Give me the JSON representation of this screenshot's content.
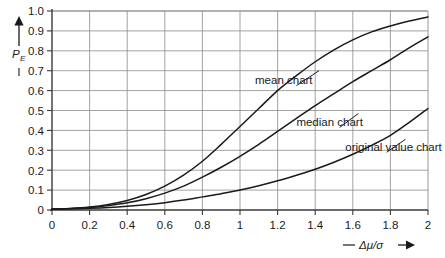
{
  "chart_data": {
    "type": "line",
    "title": "",
    "subtitle": "",
    "xlabel": "— Δμ/σ →",
    "xlabel_prefix": "—",
    "xlabel_symbol": "Δμ/σ",
    "xlabel_arrow": "→",
    "ylabel": "PE",
    "ylabel_main": "P",
    "ylabel_sub": "E",
    "ylabel_arrow": "↑",
    "xlim": [
      0,
      2
    ],
    "ylim": [
      0,
      1.0
    ],
    "grid": true,
    "legend_position": "inline-annotations",
    "xticks": [
      0,
      0.2,
      0.4,
      0.6,
      0.8,
      1,
      1.2,
      1.4,
      1.6,
      1.8,
      2
    ],
    "xticklabels": [
      "0",
      "0.2",
      "0.4",
      "0.6",
      "0.8",
      "1",
      "1.2",
      "1.4",
      "1.6",
      "1.8",
      "2"
    ],
    "yticks": [
      0,
      0.1,
      0.2,
      0.3,
      0.4,
      0.5,
      0.6,
      0.7,
      0.8,
      0.9,
      1.0
    ],
    "yticklabels": [
      "0",
      "0.1",
      "0.2",
      "0.3",
      "0.4",
      "0.5",
      "0.6",
      "0.7",
      "0.8",
      "0.9",
      "1.0"
    ],
    "x": [
      0,
      0.1,
      0.2,
      0.3,
      0.4,
      0.5,
      0.6,
      0.7,
      0.8,
      0.9,
      1.0,
      1.1,
      1.2,
      1.3,
      1.4,
      1.5,
      1.6,
      1.7,
      1.8,
      1.9,
      2.0
    ],
    "series": [
      {
        "name": "mean chart",
        "label": "mean chart",
        "values": [
          0.005,
          0.008,
          0.015,
          0.028,
          0.048,
          0.078,
          0.12,
          0.175,
          0.245,
          0.33,
          0.42,
          0.51,
          0.6,
          0.675,
          0.745,
          0.805,
          0.855,
          0.895,
          0.925,
          0.95,
          0.97
        ],
        "label_x": 1.08,
        "label_y": 0.655,
        "leader_from_x": 1.3,
        "leader_from_y": 0.625,
        "leader_to_x": 1.42,
        "leader_to_y": 0.7
      },
      {
        "name": "median chart",
        "label": "median chart",
        "values": [
          0.005,
          0.007,
          0.012,
          0.022,
          0.036,
          0.057,
          0.085,
          0.12,
          0.165,
          0.215,
          0.27,
          0.33,
          0.395,
          0.46,
          0.525,
          0.585,
          0.645,
          0.7,
          0.755,
          0.815,
          0.87
        ],
        "label_x": 1.3,
        "label_y": 0.44,
        "leader_from_x": 1.53,
        "leader_from_y": 0.415,
        "leader_to_x": 1.63,
        "leader_to_y": 0.485
      },
      {
        "name": "original value chart",
        "label": "original value chart",
        "values": [
          0.005,
          0.006,
          0.009,
          0.013,
          0.019,
          0.027,
          0.037,
          0.05,
          0.066,
          0.082,
          0.1,
          0.122,
          0.147,
          0.175,
          0.205,
          0.24,
          0.28,
          0.325,
          0.375,
          0.44,
          0.51
        ],
        "label_x": 1.56,
        "label_y": 0.315,
        "leader_from_x": 1.78,
        "leader_from_y": 0.29,
        "leader_to_x": 1.88,
        "leader_to_y": 0.355
      }
    ]
  },
  "axis": {
    "y_title_main": "P",
    "y_title_sub": "E",
    "x_title_dash": "—",
    "x_title_symbol": "Δμ/σ",
    "x_title_arrow": "➤"
  }
}
